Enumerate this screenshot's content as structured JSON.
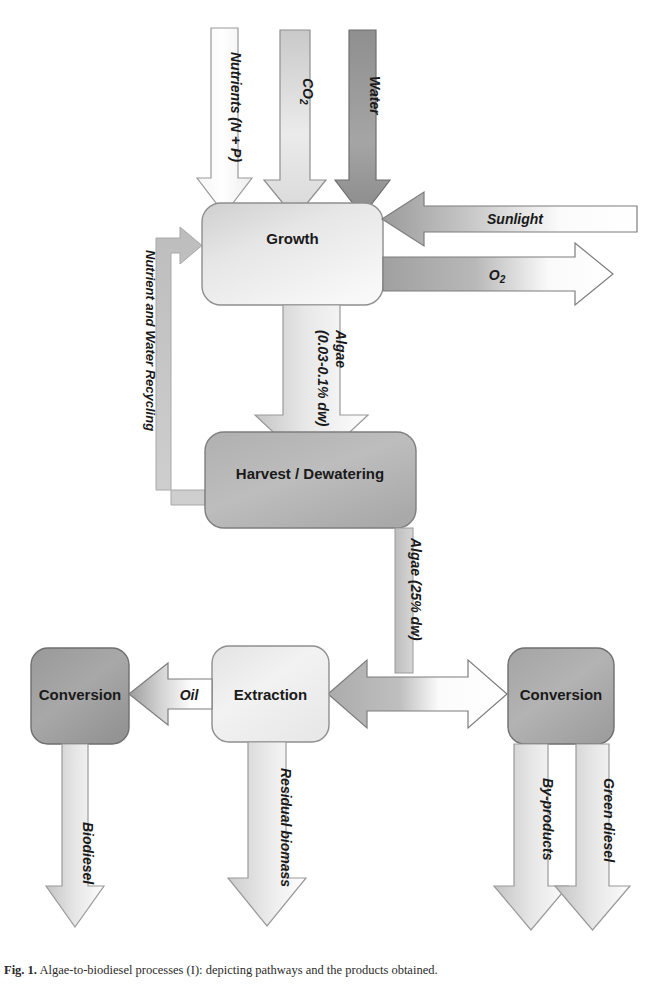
{
  "figure": {
    "caption_label": "Fig. 1.",
    "caption_text": " Algae-to-biodiesel processes (I): depicting pathways and the products obtained."
  },
  "nodes": {
    "growth": {
      "label": "Growth"
    },
    "harvest": {
      "label": "Harvest / Dewatering"
    },
    "extraction": {
      "label": "Extraction"
    },
    "conversion_left": {
      "label": "Conversion"
    },
    "conversion_right": {
      "label": "Conversion"
    }
  },
  "flows": {
    "nutrients": {
      "label": "Nutrients (N + P)",
      "direction": "down",
      "target": "growth"
    },
    "co2": {
      "label_main": "CO",
      "label_sub": "2",
      "direction": "down",
      "target": "growth"
    },
    "water": {
      "label": "Water",
      "direction": "down",
      "target": "growth"
    },
    "sunlight": {
      "label": "Sunlight",
      "direction": "left",
      "target": "growth"
    },
    "oxygen": {
      "label_main": "O",
      "label_sub": "2",
      "direction": "right",
      "source": "growth"
    },
    "recycling": {
      "label": "Nutrient and Water Recycling",
      "direction": "loop",
      "source": "harvest",
      "target": "growth"
    },
    "algae_dilute": {
      "label_line1": "Algae",
      "label_line2": "(0.03-0.1% dw)",
      "direction": "down",
      "source": "growth",
      "target": "harvest"
    },
    "algae_concentrated": {
      "label": "Algae (25% dw)",
      "direction": "down",
      "source": "harvest"
    },
    "split": {
      "direction": "bidirectional",
      "targets": [
        "extraction",
        "conversion_right"
      ]
    },
    "oil": {
      "label": "Oil",
      "direction": "left",
      "source": "extraction",
      "target": "conversion_left"
    },
    "residual_biomass": {
      "label": "Residual biomass",
      "direction": "down",
      "source": "extraction"
    },
    "biodiesel": {
      "label": "Biodiesel",
      "direction": "down",
      "source": "conversion_left"
    },
    "byproducts": {
      "label": "By-products",
      "direction": "down",
      "source": "conversion_right"
    },
    "green_diesel": {
      "label": "Green diesel",
      "direction": "down",
      "source": "conversion_right"
    }
  },
  "colors": {
    "outline": "#808080",
    "text": "#1a1a1a",
    "arrow_white": "#fdfdfd",
    "arrow_light": "#e2e2e2",
    "arrow_mid": "#b4b4b4",
    "arrow_dark": "#8d8d8d",
    "box_light": "#efefef",
    "box_mid": "#b9b9b9",
    "box_dark": "#9a9a9a",
    "background": "#ffffff"
  }
}
